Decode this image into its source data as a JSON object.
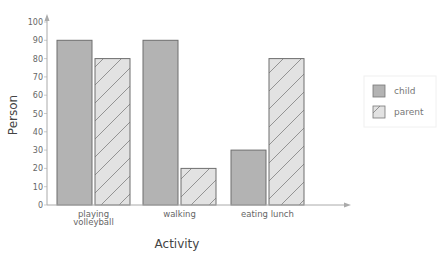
{
  "chart_data": {
    "type": "bar",
    "title": "",
    "xlabel": "Activity",
    "ylabel": "Person",
    "categories": [
      "playing volleyball",
      "walking",
      "eating lunch"
    ],
    "category_lines": [
      [
        "playing",
        "volleyball"
      ],
      [
        "walking"
      ],
      [
        "eating lunch"
      ]
    ],
    "series": [
      {
        "name": "child",
        "values": [
          90,
          90,
          30
        ],
        "color": "#b3b3b3",
        "pattern": "solid"
      },
      {
        "name": "parent",
        "values": [
          80,
          20,
          80
        ],
        "color": "#e0e0e0",
        "pattern": "diagonal-hatch"
      }
    ],
    "ylim": [
      0,
      100
    ],
    "yticks": [
      0,
      10,
      20,
      30,
      40,
      50,
      60,
      70,
      80,
      90,
      100
    ],
    "grid": false,
    "legend_position": "right"
  },
  "legend": {
    "items": [
      {
        "label": "child"
      },
      {
        "label": "parent"
      }
    ]
  }
}
